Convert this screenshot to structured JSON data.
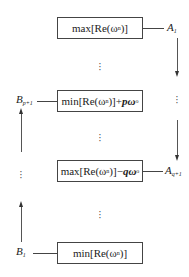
{
  "boxes": [
    {
      "id": "top",
      "prefix": "max[Re(ω",
      "sub": "n",
      "suffix": ")]",
      "extra": "",
      "extra_sub": ""
    },
    {
      "id": "upper_mid",
      "prefix": "min[Re(ω",
      "sub": "n",
      "suffix": ")]+",
      "extra": "pω",
      "extra_sub": "o"
    },
    {
      "id": "lower_mid",
      "prefix": "max[Re(ω",
      "sub": "n",
      "suffix": ")]−",
      "extra": "qω",
      "extra_sub": "o"
    },
    {
      "id": "bottom",
      "prefix": "min[Re(ω",
      "sub": "n",
      "suffix": ")]",
      "extra": "",
      "extra_sub": ""
    }
  ],
  "labels": {
    "A1": {
      "base": "A",
      "sub": "1"
    },
    "Aq1": {
      "base": "A",
      "sub": "q+1"
    },
    "Bp1": {
      "base": "B",
      "sub": "p+1"
    },
    "B1": {
      "base": "B",
      "sub": "1"
    }
  },
  "ellipsis": "⋮"
}
